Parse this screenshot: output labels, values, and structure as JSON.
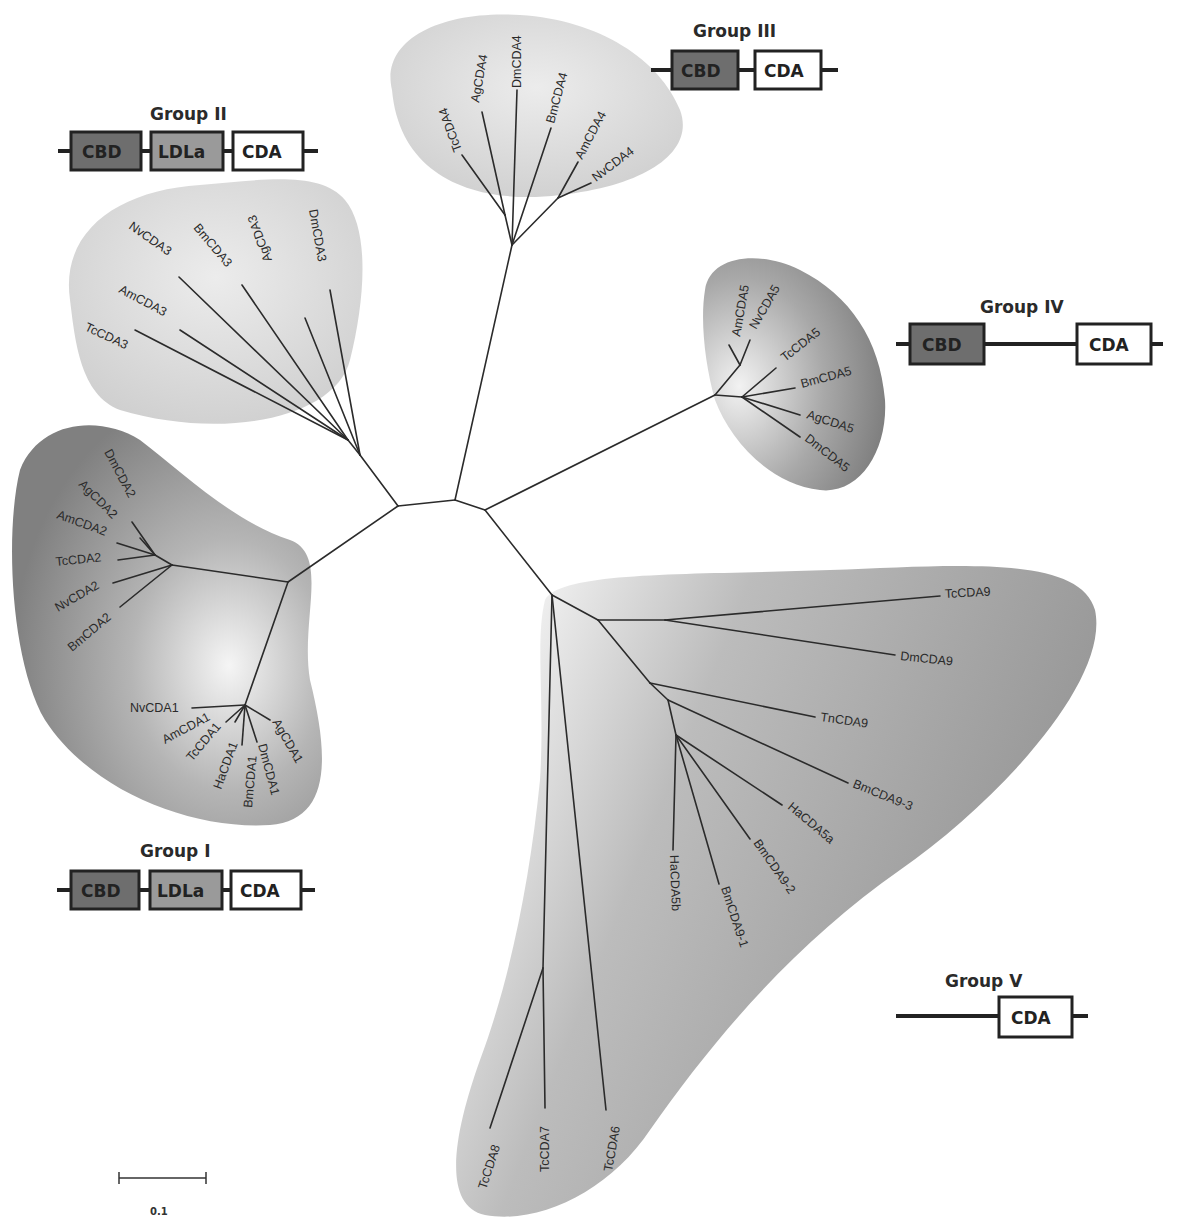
{
  "figure": {
    "type": "unrooted-phylogenetic-tree"
  },
  "colors": {
    "cbd_fill": "#6e6e6e",
    "ldla_fill": "#9a9a9a",
    "cda_fill": "#ffffff",
    "outline": "#222222",
    "light_cluster": "#d6d6d6",
    "dark_cluster": "#8a8a8a"
  },
  "groups": [
    {
      "id": "I",
      "title": "Group I",
      "domains": [
        "CBD",
        "LDLa",
        "CDA"
      ],
      "members": [
        "NvCDA1",
        "AmCDA1",
        "TcCDA1",
        "HaCDA1",
        "BmCDA1",
        "DmCDA1",
        "AgCDA1",
        "DmCDA2",
        "AgCDA2",
        "AmCDA2",
        "TcCDA2",
        "NvCDA2",
        "BmCDA2"
      ]
    },
    {
      "id": "II",
      "title": "Group II",
      "domains": [
        "CBD",
        "LDLa",
        "CDA"
      ],
      "members": [
        "NvCDA3",
        "BmCDA3",
        "AgCDA3",
        "DmCDA3",
        "AmCDA3",
        "TcCDA3"
      ]
    },
    {
      "id": "III",
      "title": "Group III",
      "domains": [
        "CBD",
        "CDA"
      ],
      "members": [
        "TcCDA4",
        "AgCDA4",
        "DmCDA4",
        "BmCDA4",
        "AmCDA4",
        "NvCDA4"
      ]
    },
    {
      "id": "IV",
      "title": "Group IV",
      "domains": [
        "CBD",
        "CDA"
      ],
      "members": [
        "AmCDA5",
        "NvCDA5",
        "TcCDA5",
        "BmCDA5",
        "AgCDA5",
        "DmCDA5"
      ]
    },
    {
      "id": "V",
      "title": "Group V",
      "domains": [
        "CDA"
      ],
      "members": [
        "TcCDA9",
        "DmCDA9",
        "TnCDA9",
        "BmCDA9-3",
        "HaCDA5a",
        "BmCDA9-2",
        "BmCDA9-1",
        "HaCDA5b",
        "TcCDA8",
        "TcCDA7",
        "TcCDA6"
      ]
    }
  ],
  "leaves": {
    "TcCDA4": "TcCDA4",
    "AgCDA4": "AgCDA4",
    "DmCDA4": "DmCDA4",
    "BmCDA4": "BmCDA4",
    "AmCDA4": "AmCDA4",
    "NvCDA4": "NvCDA4",
    "NvCDA3": "NvCDA3",
    "BmCDA3": "BmCDA3",
    "AgCDA3": "AgCDA3",
    "DmCDA3": "DmCDA3",
    "AmCDA3": "AmCDA3",
    "TcCDA3": "TcCDA3",
    "AmCDA5": "AmCDA5",
    "NvCDA5": "NvCDA5",
    "TcCDA5": "TcCDA5",
    "BmCDA5": "BmCDA5",
    "AgCDA5": "AgCDA5",
    "DmCDA5": "DmCDA5",
    "DmCDA2": "DmCDA2",
    "AgCDA2": "AgCDA2",
    "AmCDA2": "AmCDA2",
    "TcCDA2": "TcCDA2",
    "NvCDA2": "NvCDA2",
    "BmCDA2": "BmCDA2",
    "NvCDA1": "NvCDA1",
    "AmCDA1": "AmCDA1",
    "TcCDA1": "TcCDA1",
    "HaCDA1": "HaCDA1",
    "BmCDA1": "BmCDA1",
    "DmCDA1": "DmCDA1",
    "AgCDA1": "AgCDA1",
    "TcCDA9": "TcCDA9",
    "DmCDA9": "DmCDA9",
    "TnCDA9": "TnCDA9",
    "BmCDA9_3": "BmCDA9-3",
    "HaCDA5a": "HaCDA5a",
    "BmCDA9_2": "BmCDA9-2",
    "BmCDA9_1": "BmCDA9-1",
    "HaCDA5b": "HaCDA5b",
    "TcCDA8": "TcCDA8",
    "TcCDA7": "TcCDA7",
    "TcCDA6": "TcCDA6"
  },
  "legend": {
    "group1": {
      "title": "Group I",
      "d1": "CBD",
      "d2": "LDLa",
      "d3": "CDA"
    },
    "group2": {
      "title": "Group II",
      "d1": "CBD",
      "d2": "LDLa",
      "d3": "CDA"
    },
    "group3": {
      "title": "Group III",
      "d1": "CBD",
      "d2": "CDA"
    },
    "group4": {
      "title": "Group IV",
      "d1": "CBD",
      "d2": "CDA"
    },
    "group5": {
      "title": "Group V",
      "d1": "CDA"
    }
  },
  "scale_bar": {
    "label": "0.1"
  }
}
